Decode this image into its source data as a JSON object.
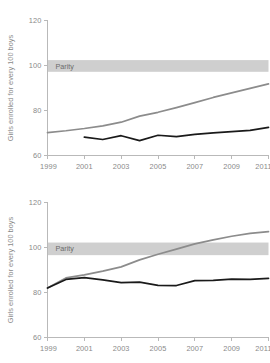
{
  "chart_data": [
    {
      "id": "top",
      "type": "line",
      "title": "",
      "xlabel": "",
      "ylabel": "Girls enrolled for every 100 boys",
      "xlim": [
        1999,
        2011
      ],
      "ylim": [
        60,
        120
      ],
      "yticks": [
        60,
        80,
        100,
        120
      ],
      "xticks": [
        1999,
        2001,
        2003,
        2005,
        2007,
        2009,
        2011
      ],
      "grid": false,
      "legend": "none",
      "annotations": [
        {
          "name": "parity-band",
          "label": "Parity",
          "type": "hband",
          "y_center": 100,
          "y_low": 97.2,
          "y_high": 102.4,
          "color": "#cfcfcf"
        }
      ],
      "series": [
        {
          "name": "gray-series",
          "color": "#8c8c8c",
          "x": [
            1999,
            2000,
            2001,
            2002,
            2003,
            2004,
            2005,
            2006,
            2007,
            2008,
            2009,
            2010,
            2011
          ],
          "values": [
            70.2,
            71.0,
            72.0,
            73.2,
            74.8,
            77.5,
            79.2,
            81.3,
            83.5,
            85.8,
            87.8,
            89.8,
            91.8
          ]
        },
        {
          "name": "black-series",
          "color": "#1a1a1a",
          "x": [
            2001,
            2002,
            2003,
            2004,
            2005,
            2006,
            2007,
            2008,
            2009,
            2010,
            2011
          ],
          "values": [
            68.2,
            67.1,
            68.8,
            66.6,
            69.0,
            68.4,
            69.4,
            70.1,
            70.6,
            71.2,
            72.5
          ]
        }
      ]
    },
    {
      "id": "bottom",
      "type": "line",
      "title": "",
      "xlabel": "",
      "ylabel": "Girls enrolled for every 100 boys",
      "xlim": [
        1999,
        2011
      ],
      "ylim": [
        60,
        120
      ],
      "yticks": [
        60,
        80,
        100,
        120
      ],
      "xticks": [
        1999,
        2001,
        2003,
        2005,
        2007,
        2009,
        2011
      ],
      "grid": false,
      "legend": "none",
      "annotations": [
        {
          "name": "parity-band",
          "label": "Parity",
          "type": "hband",
          "y_center": 100,
          "y_low": 96.6,
          "y_high": 102.2,
          "color": "#cfcfcf"
        }
      ],
      "series": [
        {
          "name": "gray-series",
          "color": "#8c8c8c",
          "x": [
            1999,
            2000,
            2001,
            2002,
            2003,
            2004,
            2005,
            2006,
            2007,
            2008,
            2009,
            2010,
            2011
          ],
          "values": [
            82.0,
            86.5,
            87.8,
            89.5,
            91.4,
            94.5,
            97.0,
            99.3,
            101.6,
            103.4,
            105.0,
            106.3,
            107.1
          ]
        },
        {
          "name": "black-series",
          "color": "#1a1a1a",
          "x": [
            1999,
            2000,
            2001,
            2002,
            2003,
            2004,
            2005,
            2006,
            2007,
            2008,
            2009,
            2010,
            2011
          ],
          "values": [
            82.0,
            85.8,
            86.6,
            85.6,
            84.4,
            84.6,
            83.2,
            83.1,
            85.3,
            85.4,
            85.9,
            85.8,
            86.3
          ]
        }
      ]
    }
  ]
}
